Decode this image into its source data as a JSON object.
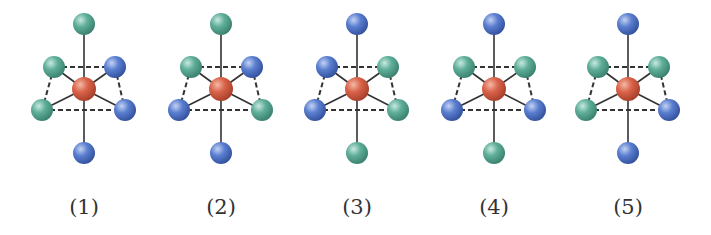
{
  "figure": {
    "colors": {
      "center": "#d9634a",
      "ligand_blue": "#5b7fd0",
      "ligand_green": "#5fae9a",
      "bond": "#333333",
      "dashed_edge": "#333333"
    },
    "ligand_positions": [
      "top",
      "upper-left",
      "upper-right",
      "lower-left",
      "lower-right",
      "bottom"
    ],
    "structures": [
      {
        "label": "(1)",
        "ligands": {
          "top": "green",
          "upper-left": "green",
          "upper-right": "blue",
          "lower-left": "green",
          "lower-right": "blue",
          "bottom": "blue"
        }
      },
      {
        "label": "(2)",
        "ligands": {
          "top": "green",
          "upper-left": "green",
          "upper-right": "blue",
          "lower-left": "blue",
          "lower-right": "green",
          "bottom": "blue"
        }
      },
      {
        "label": "(3)",
        "ligands": {
          "top": "blue",
          "upper-left": "blue",
          "upper-right": "green",
          "lower-left": "blue",
          "lower-right": "green",
          "bottom": "green"
        }
      },
      {
        "label": "(4)",
        "ligands": {
          "top": "blue",
          "upper-left": "green",
          "upper-right": "green",
          "lower-left": "blue",
          "lower-right": "blue",
          "bottom": "green"
        }
      },
      {
        "label": "(5)",
        "ligands": {
          "top": "blue",
          "upper-left": "green",
          "upper-right": "green",
          "lower-left": "green",
          "lower-right": "blue",
          "bottom": "blue"
        }
      }
    ]
  }
}
